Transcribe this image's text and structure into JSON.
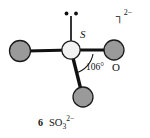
{
  "figure": {
    "kind": "lewis-structure-diagram",
    "central_atom_label": "S",
    "terminal_atom_label": "O",
    "bond_angle_label": "106°",
    "charge_bracket": {
      "bracket_glyph": "┐",
      "charge": "2−"
    },
    "lone_pair": {
      "dot_count": 2,
      "position": "top"
    },
    "caption": {
      "number": "6",
      "formula_element_1": "S",
      "formula_element_2": "O",
      "formula_subscript": "3",
      "formula_charge": "2−",
      "full_text": "6  SO3 2−"
    },
    "colors": {
      "oxygen_fill": "#9a9a9a",
      "oxygen_stroke": "#1a1a1a",
      "sulfur_fill": "#f2f2f2",
      "sulfur_stroke": "#1a1a1a",
      "bond_stroke": "#111111",
      "background": "#ffffff",
      "text": "#111111"
    },
    "atoms": [
      {
        "name": "sulfur-center",
        "element": "S",
        "cx": 71,
        "cy": 50,
        "r": 9.5,
        "fill": "#f2f2f2"
      },
      {
        "name": "oxygen-left",
        "element": "O",
        "cx": 20,
        "cy": 51,
        "r": 10.5,
        "fill": "#9a9a9a"
      },
      {
        "name": "oxygen-right",
        "element": "O",
        "cx": 114,
        "cy": 50,
        "r": 10.0,
        "fill": "#9a9a9a"
      },
      {
        "name": "oxygen-bottom",
        "element": "O",
        "cx": 83,
        "cy": 97,
        "r": 10.0,
        "fill": "#9a9a9a"
      }
    ],
    "bonds": [
      {
        "name": "bond-s-o-left",
        "x1": 71,
        "y1": 50,
        "x2": 27,
        "y2": 51,
        "width": 3.2
      },
      {
        "name": "bond-s-o-right",
        "x1": 71,
        "y1": 50,
        "x2": 108,
        "y2": 50,
        "width": 3.0
      },
      {
        "name": "bond-s-o-bottom",
        "x1": 71,
        "y1": 50,
        "x2": 81,
        "y2": 90,
        "width": 3.4
      },
      {
        "name": "bond-s-lone-pair",
        "x1": 71,
        "y1": 41,
        "x2": 71,
        "y2": 16,
        "width": 1.6
      }
    ]
  }
}
